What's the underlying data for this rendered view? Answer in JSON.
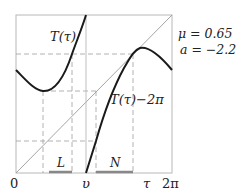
{
  "diagram": {
    "params": {
      "mu_label": "μ = 0.65",
      "a_label": "a = −2.2"
    },
    "curve_labels": {
      "T": "T(τ)",
      "T_minus": "T(τ)−2π"
    },
    "interval_labels": {
      "L": "L",
      "N": "N"
    },
    "axis_labels": {
      "origin": "0",
      "v": "υ",
      "tau": "τ",
      "two_pi": "2π"
    },
    "colors": {
      "curve": "#1a1a1a",
      "diagonal": "#9a9a9a",
      "box": "#b8b8b8",
      "dashed": "#a0a0a0",
      "interval": "#888888"
    }
  }
}
